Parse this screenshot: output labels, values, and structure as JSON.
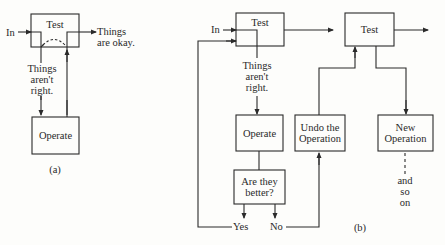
{
  "diagram_a": {
    "caption": "(a)",
    "test_box": "Test",
    "input_label": "In",
    "ok_label_1": "Things",
    "ok_label_2": "are okay.",
    "not_right_1": "Things",
    "not_right_2": "aren't",
    "not_right_3": "right.",
    "operate_box": "Operate"
  },
  "diagram_b": {
    "caption": "(b)",
    "test_box_1": "Test",
    "input_label": "In",
    "not_right_1": "Things",
    "not_right_2": "aren't",
    "not_right_3": "right.",
    "operate_box": "Operate",
    "question_1": "Are they",
    "question_2": "better?",
    "yes_label": "Yes",
    "no_label": "No",
    "undo_1": "Undo the",
    "undo_2": "Operation",
    "test_box_2": "Test",
    "new_op_1": "New",
    "new_op_2": "Operation",
    "continue_1": "and",
    "continue_2": "so",
    "continue_3": "on"
  },
  "colors": {
    "ink": "#2a2a2a",
    "paper": "#fdfdfb"
  }
}
